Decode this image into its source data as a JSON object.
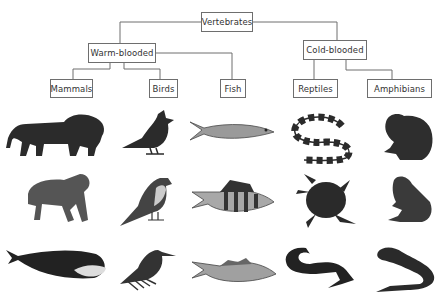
{
  "tree": {
    "root": {
      "label": "Vertebrates"
    },
    "groups": [
      {
        "label": "Warm-blooded"
      },
      {
        "label": "Cold-blooded"
      }
    ],
    "classes": [
      {
        "label": "Mammals",
        "parent": "Warm-blooded"
      },
      {
        "label": "Birds",
        "parent": "Warm-blooded"
      },
      {
        "label": "Fish",
        "parent": "Warm-blooded"
      },
      {
        "label": "Reptiles",
        "parent": "Cold-blooded"
      },
      {
        "label": "Amphibians",
        "parent": "Cold-blooded"
      }
    ]
  },
  "columns": [
    {
      "class": "Mammals",
      "animals": [
        "lion",
        "chimpanzee",
        "whale"
      ]
    },
    {
      "class": "Birds",
      "animals": [
        "cardinal",
        "sparrow",
        "hummingbird"
      ]
    },
    {
      "class": "Fish",
      "animals": [
        "mackerel",
        "perch",
        "cod"
      ]
    },
    {
      "class": "Reptiles",
      "animals": [
        "banded-snake",
        "sea-turtle",
        "crocodile"
      ]
    },
    {
      "class": "Amphibians",
      "animals": [
        "toad",
        "frog",
        "salamander"
      ]
    }
  ],
  "colors": {
    "line": "#6e6e6e",
    "box_border": "#6e6e6e",
    "text": "#333333",
    "silhouette": "#2b2b2b"
  }
}
